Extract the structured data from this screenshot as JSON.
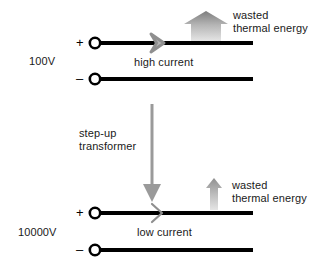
{
  "diagram": {
    "colors": {
      "wire": "#000000",
      "text": "#1a1a1a",
      "arrow_gray_dark": "#8a8a8a",
      "arrow_gray_light": "#d8d8d8",
      "transformer_arrow": "#9a9a9a",
      "background": "#ffffff"
    },
    "circuits": [
      {
        "id": "low-voltage-circuit",
        "voltage_label": "100V",
        "plus_sign": "+",
        "minus_sign": "–",
        "current_label": "high current",
        "waste_label_line1": "wasted",
        "waste_label_line2": "thermal energy",
        "waste_arrow_size": "large",
        "current_arrow_size": "thick"
      },
      {
        "id": "high-voltage-circuit",
        "voltage_label": "10000V",
        "plus_sign": "+",
        "minus_sign": "–",
        "current_label": "low current",
        "waste_label_line1": "wasted",
        "waste_label_line2": "thermal energy",
        "waste_arrow_size": "small",
        "current_arrow_size": "thin"
      }
    ],
    "transformer": {
      "label_line1": "step-up",
      "label_line2": "transformer"
    }
  }
}
